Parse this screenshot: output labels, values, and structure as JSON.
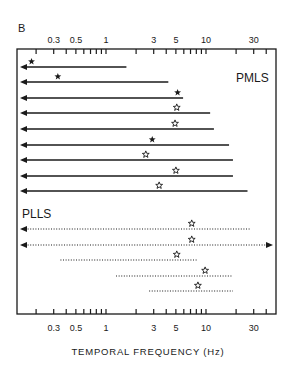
{
  "panel_label": "B",
  "chart_data": {
    "type": "range",
    "title": "",
    "xlabel": "TEMPORAL FREQUENCY (Hz)",
    "ylabel": "",
    "xscale": "log",
    "xlim": [
      0.14,
      45
    ],
    "tick_labels": [
      "0.3",
      "0.5",
      "1",
      "3",
      "5",
      "10",
      "30"
    ],
    "tick_label_values": [
      0.3,
      0.5,
      1,
      3,
      5,
      10,
      30
    ],
    "minor_ticks": [
      0.2,
      0.3,
      0.4,
      0.5,
      0.6,
      0.7,
      0.8,
      0.9,
      1,
      2,
      3,
      4,
      5,
      6,
      7,
      8,
      9,
      10,
      20,
      30,
      40
    ],
    "legend_note": "filled star = peak marker; open star = peak marker (open symbol); left arrow = extends below range; right arrow = extends above range",
    "groups": [
      {
        "name": "PMLS",
        "line_style": "solid",
        "cells": [
          {
            "low": null,
            "high": 1.6,
            "extends_low": true,
            "extends_high": false,
            "peak": 0.18,
            "marker": "filled-star"
          },
          {
            "low": null,
            "high": 4.2,
            "extends_low": true,
            "extends_high": false,
            "peak": 0.33,
            "marker": "filled-star"
          },
          {
            "low": null,
            "high": 5.9,
            "extends_low": true,
            "extends_high": false,
            "peak": 5.2,
            "marker": "filled-star"
          },
          {
            "low": null,
            "high": 11,
            "extends_low": true,
            "extends_high": false,
            "peak": 5.1,
            "marker": "open-star"
          },
          {
            "low": null,
            "high": 12,
            "extends_low": true,
            "extends_high": false,
            "peak": 4.9,
            "marker": "open-star"
          },
          {
            "low": null,
            "high": 17,
            "extends_low": true,
            "extends_high": false,
            "peak": 2.9,
            "marker": "filled-star"
          },
          {
            "low": null,
            "high": 18.6,
            "extends_low": true,
            "extends_high": false,
            "peak": 2.5,
            "marker": "open-star"
          },
          {
            "low": null,
            "high": 18.6,
            "extends_low": true,
            "extends_high": false,
            "peak": 5.0,
            "marker": "open-star"
          },
          {
            "low": null,
            "high": 26,
            "extends_low": true,
            "extends_high": false,
            "peak": 3.4,
            "marker": "open-star"
          }
        ]
      },
      {
        "name": "PLLS",
        "line_style": "dotted",
        "cells": [
          {
            "low": null,
            "high": 28,
            "extends_low": true,
            "extends_high": false,
            "peak": 7.2,
            "marker": "open-star"
          },
          {
            "low": null,
            "high": null,
            "extends_low": true,
            "extends_high": true,
            "peak": 7.2,
            "marker": "open-star"
          },
          {
            "low": 0.35,
            "high": 8.1,
            "extends_low": false,
            "extends_high": false,
            "peak": 5.1,
            "marker": "open-star"
          },
          {
            "low": 1.26,
            "high": 18.6,
            "extends_low": false,
            "extends_high": false,
            "peak": 9.8,
            "marker": "open-star"
          },
          {
            "low": 2.7,
            "high": 18.6,
            "extends_low": false,
            "extends_high": false,
            "peak": 8.3,
            "marker": "open-star"
          }
        ]
      }
    ]
  },
  "layout": {
    "frame": {
      "left": 17,
      "right": 276,
      "top": 49,
      "bottom": 314
    },
    "x_origin_px": 106,
    "px_per_decade": 100,
    "pmls_rows_y": [
      67,
      82,
      98,
      113,
      129,
      145,
      160,
      176,
      191
    ],
    "plls_rows_y": [
      229,
      245,
      260,
      276,
      291
    ],
    "pmls_label_pos": [
      236,
      82
    ],
    "plls_label_pos": [
      22,
      218
    ],
    "colors": {
      "ink": "#1a1a1a",
      "background": "#ffffff"
    }
  }
}
